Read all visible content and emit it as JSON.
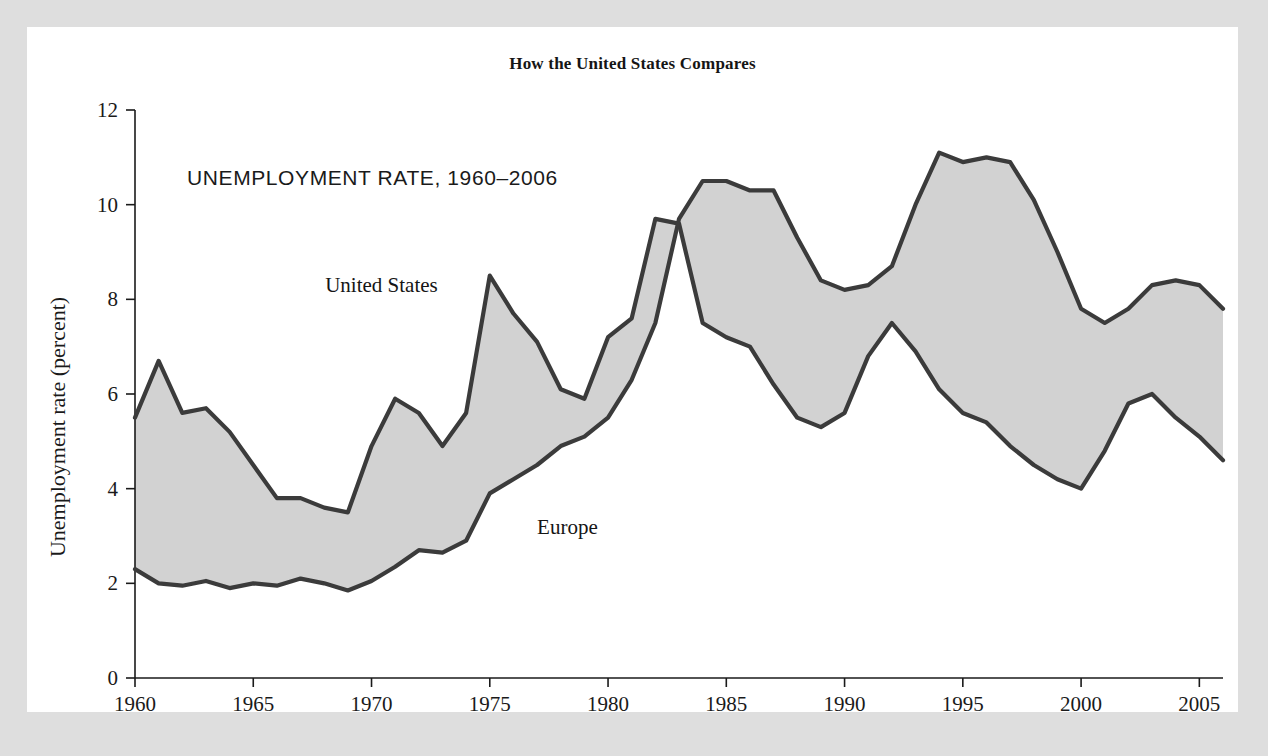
{
  "figure": {
    "title": "How the United States Compares",
    "subtitle": "UNEMPLOYMENT RATE, 1960–2006",
    "panel_background": "#ffffff",
    "frame_background": "#dfdfdf"
  },
  "chart_data": {
    "type": "line",
    "title": "How the United States Compares",
    "subtitle": "UNEMPLOYMENT RATE, 1960–2006",
    "xlabel": "",
    "ylabel": "Unemployment rate (percent)",
    "xlim": [
      1960,
      2006
    ],
    "ylim": [
      0,
      12
    ],
    "xticks": [
      1960,
      1965,
      1970,
      1975,
      1980,
      1985,
      1990,
      1995,
      2000,
      2005
    ],
    "xticklabels": [
      "1960",
      "1965",
      "1970",
      "1975",
      "1980",
      "1985",
      "1990",
      "1995",
      "2000",
      "2005"
    ],
    "yticks": [
      0,
      2,
      4,
      6,
      8,
      10,
      12
    ],
    "yticklabels": [
      "0",
      "2",
      "4",
      "6",
      "8",
      "10",
      "12"
    ],
    "grid": false,
    "legend_position": "inline-annotation",
    "fill_between": true,
    "fill_color": "#d2d2d2",
    "line_color": "#3b3b3b",
    "x": [
      1960,
      1961,
      1962,
      1963,
      1964,
      1965,
      1966,
      1967,
      1968,
      1969,
      1970,
      1971,
      1972,
      1973,
      1974,
      1975,
      1976,
      1977,
      1978,
      1979,
      1980,
      1981,
      1982,
      1983,
      1984,
      1985,
      1986,
      1987,
      1988,
      1989,
      1990,
      1991,
      1992,
      1993,
      1994,
      1995,
      1996,
      1997,
      1998,
      1999,
      2000,
      2001,
      2002,
      2003,
      2004,
      2005,
      2006
    ],
    "series": [
      {
        "name": "United States",
        "label_position": {
          "x": 1972.8,
          "y": 8.15
        },
        "values": [
          5.5,
          6.7,
          5.6,
          5.7,
          5.2,
          4.5,
          3.8,
          3.8,
          3.6,
          3.5,
          4.9,
          5.9,
          5.6,
          4.9,
          5.6,
          8.5,
          7.7,
          7.1,
          6.1,
          5.9,
          7.2,
          7.6,
          9.7,
          9.6,
          7.5,
          7.2,
          7.0,
          6.2,
          5.5,
          5.3,
          5.6,
          6.8,
          7.5,
          6.9,
          6.1,
          5.6,
          5.4,
          4.9,
          4.5,
          4.2,
          4.0,
          4.8,
          5.8,
          6.0,
          5.5,
          5.1,
          4.6
        ]
      },
      {
        "name": "Europe",
        "label_position": {
          "x": 1977.0,
          "y": 3.05
        },
        "values": [
          2.3,
          2.0,
          1.95,
          2.05,
          1.9,
          2.0,
          1.95,
          2.1,
          2.0,
          1.85,
          2.05,
          2.35,
          2.7,
          2.65,
          2.9,
          3.9,
          4.2,
          4.5,
          4.9,
          5.1,
          5.5,
          6.3,
          7.5,
          9.7,
          10.5,
          10.5,
          10.3,
          10.3,
          9.3,
          8.4,
          8.2,
          8.3,
          8.7,
          10.0,
          11.1,
          10.9,
          11.0,
          10.9,
          10.1,
          9.0,
          7.8,
          7.5,
          7.8,
          8.3,
          8.4,
          8.3,
          7.8
        ]
      }
    ],
    "annotations": [
      {
        "text": "United States",
        "x": 1972.8,
        "y": 8.15
      },
      {
        "text": "Europe",
        "x": 1977.0,
        "y": 3.05
      }
    ]
  }
}
